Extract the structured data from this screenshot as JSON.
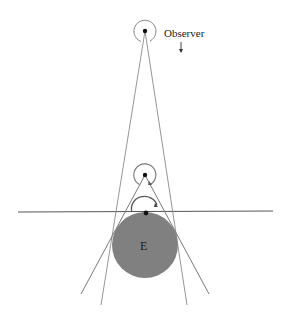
{
  "diagram": {
    "observer_label": "Observer",
    "earth_label": "E",
    "colors": {
      "earth_fill": "#808080",
      "line": "#7a7a7a",
      "horizon": "#555555",
      "dot": "#111111"
    },
    "elements": {
      "observer_high": {
        "x": 145,
        "y": 31
      },
      "observer_mid": {
        "x": 145,
        "y": 175
      },
      "observer_surface": {
        "x": 146,
        "y": 213
      },
      "earth": {
        "cx": 145,
        "cy": 245,
        "r": 33
      },
      "horizon_line": {
        "x1": 18,
        "y1": 212,
        "x2": 273,
        "y2": 211
      }
    }
  }
}
